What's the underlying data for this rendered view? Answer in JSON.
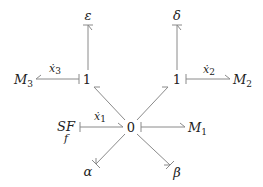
{
  "diagram": {
    "type": "bond-graph",
    "junctions": {
      "zero": {
        "label": "0",
        "x": 131,
        "y": 127
      },
      "one_left": {
        "label": "1",
        "x": 86,
        "y": 79
      },
      "one_right": {
        "label": "1",
        "x": 177,
        "y": 79
      }
    },
    "elements": {
      "M1": {
        "base": "M",
        "sub": "1"
      },
      "M2": {
        "base": "M",
        "sub": "2"
      },
      "M3": {
        "base": "M",
        "sub": "3"
      },
      "SF": {
        "base": "SF",
        "sub": "f"
      },
      "epsilon": {
        "label": "ε"
      },
      "delta": {
        "label": "δ"
      },
      "alpha": {
        "label": "α"
      },
      "beta": {
        "label": "β"
      }
    },
    "flows": {
      "x1": {
        "base": "ẋ",
        "sub": "1"
      },
      "x2": {
        "base": "ẋ",
        "sub": "2"
      },
      "x3": {
        "base": "ẋ",
        "sub": "3"
      }
    },
    "bonds": [
      {
        "from": "SF",
        "to": "0",
        "flow": "ẋ1"
      },
      {
        "from": "0",
        "to": "M1"
      },
      {
        "from": "0",
        "to": "1 (left)"
      },
      {
        "from": "0",
        "to": "1 (right)"
      },
      {
        "from": "0",
        "to": "α"
      },
      {
        "from": "0",
        "to": "β"
      },
      {
        "from": "1 (left)",
        "to": "M3",
        "flow": "ẋ3"
      },
      {
        "from": "1 (left)",
        "to": "ε"
      },
      {
        "from": "1 (right)",
        "to": "M2",
        "flow": "ẋ2"
      },
      {
        "from": "1 (right)",
        "to": "δ"
      }
    ],
    "colors": {
      "bond": "#8a8a8a",
      "text": "#222222"
    }
  }
}
